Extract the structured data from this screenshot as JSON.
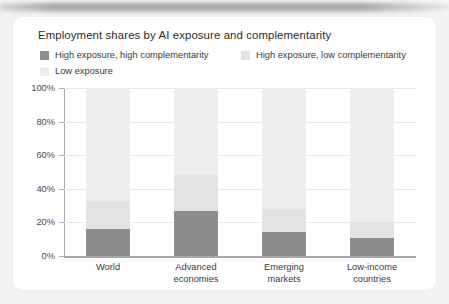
{
  "card": {
    "title": "Employment shares by AI exposure and complementarity"
  },
  "colors": {
    "high_exposure_high_comp": "#8d8d8d",
    "high_exposure_low_comp": "#e3e3e3",
    "low_exposure": "#ededed",
    "axis": "#a8a8a8",
    "grid": "#e6e6e6",
    "card_background": "#ffffff",
    "page_background": "#f2f2f2",
    "text": "#2b2b2b"
  },
  "chart_data": {
    "type": "bar",
    "stacked": true,
    "stack_mode": "percent",
    "title": "Employment shares by AI exposure and complementarity",
    "xlabel": "",
    "ylabel": "",
    "ylim": [
      0,
      100
    ],
    "yticks": [
      0,
      20,
      40,
      60,
      80,
      100
    ],
    "ytick_labels": [
      "0%",
      "20%",
      "40%",
      "60%",
      "80%",
      "100%"
    ],
    "grid": true,
    "legend_position": "top",
    "categories": [
      "World",
      "Advanced economies",
      "Emerging markets",
      "Low-income countries"
    ],
    "category_lines": [
      [
        "World"
      ],
      [
        "Advanced",
        "economies"
      ],
      [
        "Emerging",
        "markets"
      ],
      [
        "Low-income",
        "countries"
      ]
    ],
    "series": [
      {
        "name": "High exposure, high complementarity",
        "color": "#8d8d8d",
        "values": [
          16,
          27,
          14,
          11
        ]
      },
      {
        "name": "High exposure, low complementarity",
        "color": "#e3e3e3",
        "values": [
          17,
          21,
          14,
          9
        ]
      },
      {
        "name": "Low exposure",
        "color": "#ededed",
        "values": [
          67,
          52,
          72,
          80
        ]
      }
    ]
  }
}
